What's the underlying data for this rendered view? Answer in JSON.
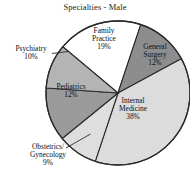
{
  "chart_data": {
    "type": "pie",
    "title": "Specialties - Male",
    "xlabel": "",
    "ylabel": "",
    "legend": "none",
    "grid": false,
    "units": "percent",
    "categories": [
      "Family Practice",
      "General Surgery",
      "Internal Medicine",
      "Obstetrics/Gynecology",
      "Pediatrics",
      "Psychiatry"
    ],
    "values": [
      19,
      12,
      38,
      9,
      12,
      10
    ],
    "slices": [
      {
        "name": "family-practice",
        "label_line1": "Family",
        "label_line2": "Practice",
        "percent_text": "19%",
        "value": 19,
        "color": "#ffffff",
        "leader_line": false
      },
      {
        "name": "general-surgery",
        "label_line1": "General",
        "label_line2": "Surgery",
        "percent_text": "12%",
        "value": 12,
        "color": "#8d8d8d",
        "leader_line": false
      },
      {
        "name": "internal-medicine",
        "label_line1": "Internal",
        "label_line2": "Medicine",
        "percent_text": "38%",
        "value": 38,
        "color": "#dcdcdc",
        "leader_line": false
      },
      {
        "name": "obstetrics-gynecology",
        "label_line1": "Obstetrics/",
        "label_line2": "Gynecology",
        "percent_text": "9%",
        "value": 9,
        "color": "#dedede",
        "leader_line": true
      },
      {
        "name": "pediatrics",
        "label_line1": "Pediatrics",
        "label_line2": "",
        "percent_text": "12%",
        "value": 12,
        "color": "#9b9b9b",
        "leader_line": false
      },
      {
        "name": "psychiatry",
        "label_line1": "Psychiatry",
        "label_line2": "",
        "percent_text": "10%",
        "value": 10,
        "color": "#b4b4b4",
        "leader_line": true
      }
    ],
    "colors": {
      "outline": "#2b2b2b",
      "background": "#ffffff",
      "text": "#0f0f0f"
    }
  }
}
